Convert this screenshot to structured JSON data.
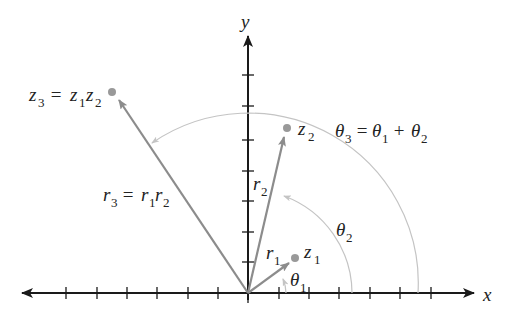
{
  "diagram": {
    "axes": {
      "x_label": "x",
      "y_label": "y",
      "origin": [
        248,
        293
      ],
      "tick_spacing": 30.5,
      "x_ticks_left": 6,
      "x_ticks_right": 6,
      "y_ticks_up": 7
    },
    "points": [
      {
        "id": "z1",
        "label": "z",
        "sub": "1",
        "pos": [
          295,
          258
        ]
      },
      {
        "id": "z2",
        "label": "z",
        "sub": "2",
        "pos": [
          287,
          128
        ]
      },
      {
        "id": "z3",
        "label": "z",
        "sub": "3",
        "pos": [
          112,
          92
        ]
      }
    ],
    "vectors": [
      {
        "id": "r1",
        "label": "r",
        "sub": "1"
      },
      {
        "id": "r2",
        "label": "r",
        "sub": "2"
      },
      {
        "id": "r3",
        "label": "r",
        "sub": "3"
      }
    ],
    "angles": [
      {
        "id": "theta1",
        "label": "θ",
        "sub": "1"
      },
      {
        "id": "theta2",
        "label": "θ",
        "sub": "2"
      },
      {
        "id": "theta3",
        "label": "θ",
        "sub": "3"
      }
    ],
    "equations": {
      "z3": {
        "lhs": "z",
        "lhs_sub": "3",
        "eq": " = ",
        "a": "z",
        "a_sub": "1",
        "b": "z",
        "b_sub": "2"
      },
      "r3": {
        "lhs": "r",
        "lhs_sub": "3",
        "eq": " = ",
        "a": "r",
        "a_sub": "1",
        "b": "r",
        "b_sub": "2"
      },
      "theta3": {
        "lhs": "θ",
        "lhs_sub": "3",
        "eq": " = ",
        "a": "θ",
        "a_sub": "1",
        "plus": " + ",
        "b": "θ",
        "b_sub": "2"
      }
    },
    "colors": {
      "axis": "#1a1a1a",
      "vector": "#8c8c8c",
      "arc": "#c4c4c4",
      "point": "#999999",
      "text": "#222222"
    }
  }
}
